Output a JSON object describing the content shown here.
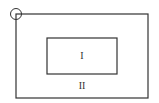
{
  "diagram": {
    "regions": [
      {
        "id": "inner",
        "label": "I"
      },
      {
        "id": "outer",
        "label": "II"
      }
    ],
    "marker": {
      "shape": "circle",
      "position": "top-left corner of outer rectangle"
    },
    "colors": {
      "stroke": "#333333",
      "background": "#ffffff"
    }
  }
}
